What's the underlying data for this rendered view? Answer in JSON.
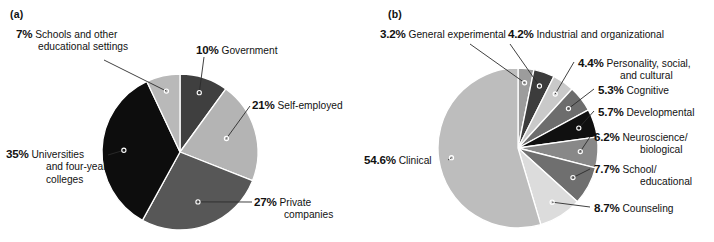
{
  "figure": {
    "panels": [
      {
        "tag": "(a)",
        "chart_data": {
          "type": "pie",
          "title": "",
          "start_angle_deg": 0,
          "direction": "clockwise",
          "legend": "callout-labels",
          "categories": [
            "Government",
            "Self-employed",
            "Private companies",
            "Universities and four-year colleges",
            "Schools and other educational settings"
          ],
          "values": [
            10,
            21,
            27,
            35,
            7
          ],
          "value_unit": "%",
          "colors": [
            "#3f3f3f",
            "#b4b4b4",
            "#575757",
            "#0d0d0d",
            "#b9b9b9"
          ]
        },
        "labels": [
          {
            "name": "slice-label-schools",
            "pct": "7%",
            "line1": "Schools and other",
            "line2": "educational settings"
          },
          {
            "name": "slice-label-government",
            "pct": "10%",
            "line1": "Government",
            "line2": ""
          },
          {
            "name": "slice-label-self-employed",
            "pct": "21%",
            "line1": "Self-employed",
            "line2": ""
          },
          {
            "name": "slice-label-private-companies",
            "pct": "27%",
            "line1": "Private",
            "line2": "companies"
          },
          {
            "name": "slice-label-universities",
            "pct": "35%",
            "line1": "Universities",
            "line2": "and four-year",
            "line3": "colleges"
          }
        ]
      },
      {
        "tag": "(b)",
        "chart_data": {
          "type": "pie",
          "title": "",
          "start_angle_deg": 0,
          "direction": "clockwise",
          "legend": "callout-labels",
          "categories": [
            "General experimental",
            "Industrial and organizational",
            "Personality, social, and cultural",
            "Cognitive",
            "Developmental",
            "Neuroscience/biological",
            "School/educational",
            "Counseling",
            "Clinical"
          ],
          "values": [
            3.2,
            4.2,
            4.4,
            5.3,
            5.7,
            6.2,
            7.7,
            8.7,
            54.6
          ],
          "value_unit": "%",
          "colors": [
            "#9c9c9c",
            "#3c3c3c",
            "#c9c9c9",
            "#6d6d6d",
            "#101010",
            "#888888",
            "#6f6f6f",
            "#dcdcdc",
            "#bdbdbd"
          ]
        },
        "labels": [
          {
            "name": "slice-label-general-experimental",
            "pct": "3.2%",
            "line1": "General experimental",
            "line2": ""
          },
          {
            "name": "slice-label-industrial-organizational",
            "pct": "4.2%",
            "line1": "Industrial and organizational",
            "line2": ""
          },
          {
            "name": "slice-label-personality-social-cultural",
            "pct": "4.4%",
            "line1": "Personality, social,",
            "line2": "and cultural"
          },
          {
            "name": "slice-label-cognitive",
            "pct": "5.3%",
            "line1": "Cognitive",
            "line2": ""
          },
          {
            "name": "slice-label-developmental",
            "pct": "5.7%",
            "line1": "Developmental",
            "line2": ""
          },
          {
            "name": "slice-label-neuroscience-biological",
            "pct": "6.2%",
            "line1": "Neuroscience/",
            "line2": "biological"
          },
          {
            "name": "slice-label-school-educational",
            "pct": "7.7%",
            "line1": "School/",
            "line2": "educational"
          },
          {
            "name": "slice-label-counseling",
            "pct": "8.7%",
            "line1": "Counseling",
            "line2": ""
          },
          {
            "name": "slice-label-clinical",
            "pct": "54.6%",
            "line1": "Clinical",
            "line2": ""
          }
        ]
      }
    ]
  }
}
